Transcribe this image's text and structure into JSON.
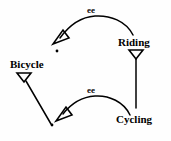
{
  "diagram": {
    "type": "concept-graph",
    "background_color": "#fefefe",
    "stroke_color": "#000000",
    "nodes": [
      {
        "id": "bicycle",
        "label": "Bicycle",
        "x": 10,
        "y": 58
      },
      {
        "id": "riding",
        "label": "Riding",
        "x": 118,
        "y": 36
      },
      {
        "id": "cycling",
        "label": "Cycling",
        "x": 116,
        "y": 113
      }
    ],
    "instance_dots": [
      {
        "id": "dot-upper",
        "x": 57,
        "y": 51
      },
      {
        "id": "dot-lower",
        "x": 52,
        "y": 125
      }
    ],
    "edges": [
      {
        "id": "edge-riding-to-dot-upper",
        "label": "ee",
        "from": "riding",
        "to": "dot-upper",
        "shape": "curved-arc",
        "label_x": 87,
        "label_y": 6
      },
      {
        "id": "edge-cycling-to-dot-lower",
        "label": "ee",
        "from": "cycling",
        "to": "dot-lower",
        "shape": "curved-arc",
        "label_x": 87,
        "label_y": 86
      },
      {
        "id": "edge-bicycle-to-dot-lower",
        "label": "",
        "from": "bicycle",
        "to": "dot-lower",
        "shape": "straight-line"
      },
      {
        "id": "edge-riding-to-cycling",
        "label": "",
        "from": "riding",
        "to": "cycling",
        "shape": "vertical-line"
      }
    ]
  }
}
